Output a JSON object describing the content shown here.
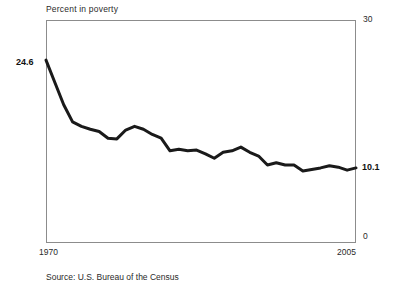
{
  "chart": {
    "title": "Percent in poverty",
    "source": "Source:  U.S. Bureau of the Census",
    "start_value_label": "24.6",
    "end_value_label": "10.1",
    "y_tick_top": "30",
    "y_tick_bottom": "0",
    "x_tick_left": "1970",
    "x_tick_right": "2005",
    "line_color": "#1a1a1a",
    "frame_color": "#8c8c8c",
    "background_color": "#ffffff"
  },
  "chart_data": {
    "type": "line",
    "title": "Percent in poverty",
    "xlabel": "",
    "ylabel": "Percent in poverty",
    "xlim": [
      1970,
      2005
    ],
    "ylim": [
      0,
      30
    ],
    "grid": false,
    "legend": "none",
    "x_tick_labels": [
      "1970",
      "2005"
    ],
    "y_tick_labels": [
      "0",
      "30"
    ],
    "annotations": [
      {
        "text": "24.6",
        "x": 1970,
        "y": 24.6,
        "position": "left"
      },
      {
        "text": "10.1",
        "x": 2005,
        "y": 10.1,
        "position": "right"
      }
    ],
    "series": [
      {
        "name": "Percent in poverty",
        "x": [
          1970,
          1971,
          1972,
          1973,
          1974,
          1975,
          1976,
          1977,
          1978,
          1979,
          1980,
          1981,
          1982,
          1983,
          1984,
          1985,
          1986,
          1987,
          1988,
          1989,
          1990,
          1991,
          1992,
          1993,
          1994,
          1995,
          1996,
          1997,
          1998,
          1999,
          2000,
          2001,
          2002,
          2003,
          2004,
          2005
        ],
        "values": [
          24.6,
          21.6,
          18.6,
          16.3,
          15.7,
          15.3,
          15.0,
          14.1,
          14.0,
          15.2,
          15.7,
          15.3,
          14.6,
          14.1,
          12.4,
          12.6,
          12.4,
          12.5,
          12.0,
          11.4,
          12.2,
          12.4,
          12.9,
          12.2,
          11.7,
          10.5,
          10.8,
          10.5,
          10.5,
          9.7,
          9.9,
          10.1,
          10.4,
          10.2,
          9.8,
          10.1
        ]
      }
    ]
  }
}
